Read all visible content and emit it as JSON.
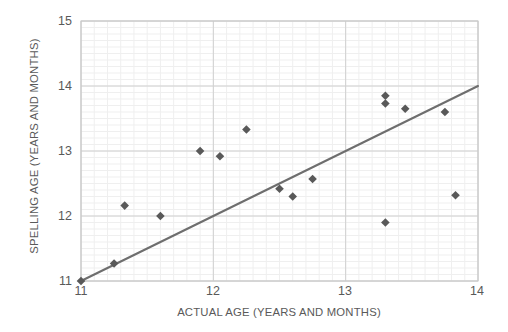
{
  "chart_data": {
    "type": "scatter",
    "title": "",
    "xlabel": "ACTUAL AGE (YEARS AND MONTHS)",
    "ylabel": "SPELLING AGE (YEARS AND MONTHS)",
    "xlim": [
      11,
      14
    ],
    "ylim": [
      11,
      15
    ],
    "xticks": [
      11,
      12,
      13,
      14
    ],
    "yticks": [
      11,
      12,
      13,
      14,
      15
    ],
    "xtick_labels": [
      "11",
      "12",
      "13",
      "14"
    ],
    "ytick_labels": [
      "11",
      "12",
      "13",
      "14",
      "15"
    ],
    "grid": "major and faint minor gridlines, both axes",
    "legend": "none",
    "marker": "diamond",
    "marker_color": "#595959",
    "points": [
      {
        "x": 11.0,
        "y": 11.0
      },
      {
        "x": 11.25,
        "y": 11.27
      },
      {
        "x": 11.33,
        "y": 12.16
      },
      {
        "x": 11.6,
        "y": 12.0
      },
      {
        "x": 11.9,
        "y": 13.0
      },
      {
        "x": 12.05,
        "y": 12.92
      },
      {
        "x": 12.25,
        "y": 13.33
      },
      {
        "x": 12.5,
        "y": 12.42
      },
      {
        "x": 12.6,
        "y": 12.3
      },
      {
        "x": 12.75,
        "y": 12.57
      },
      {
        "x": 13.3,
        "y": 13.85
      },
      {
        "x": 13.3,
        "y": 13.73
      },
      {
        "x": 13.3,
        "y": 11.9
      },
      {
        "x": 13.45,
        "y": 13.65
      },
      {
        "x": 13.75,
        "y": 13.6
      },
      {
        "x": 13.83,
        "y": 12.32
      }
    ],
    "trendline": {
      "type": "linear",
      "x_start": 11.0,
      "y_start": 11.0,
      "x_end": 14.0,
      "y_end": 14.0,
      "color": "#6e6e6e"
    },
    "colors": {
      "marker": "#595959",
      "trendline": "#6e6e6e",
      "major_grid": "#d0d0d0",
      "minor_grid": "#efefef",
      "plot_border": "#c8c8c8",
      "text": "#595959",
      "background": "#ffffff"
    }
  }
}
